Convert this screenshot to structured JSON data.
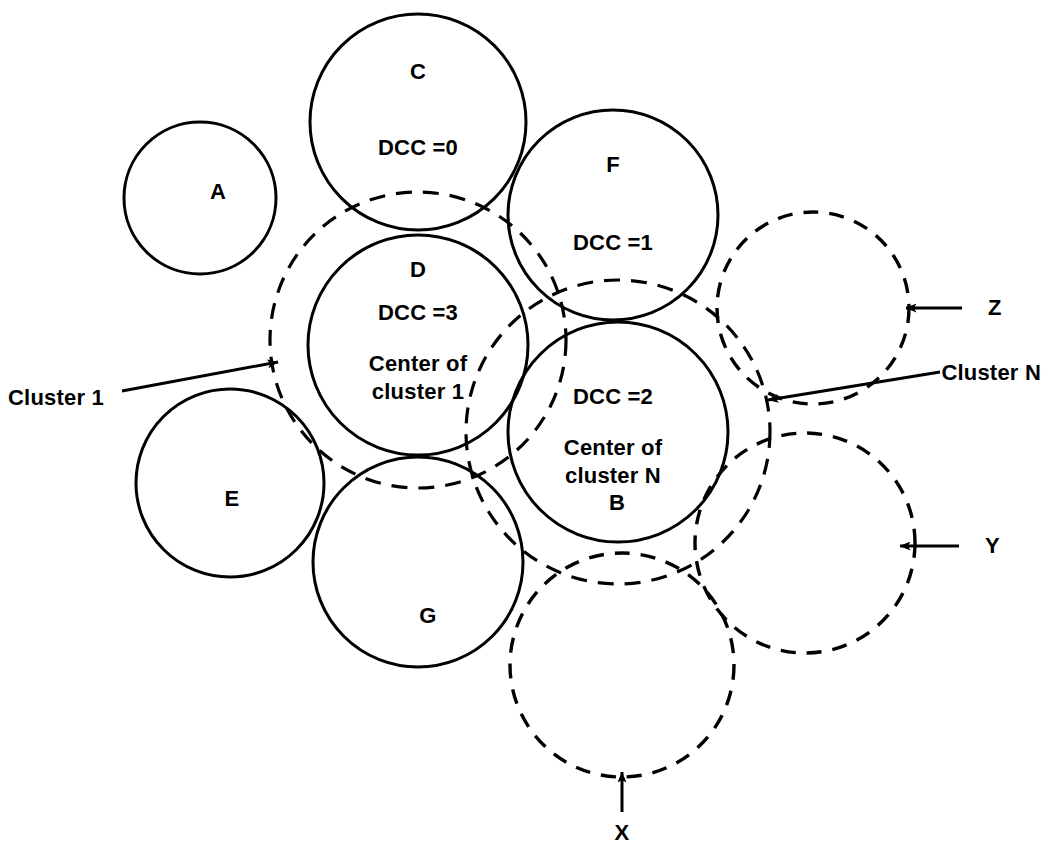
{
  "figure": {
    "type": "packing-diagram",
    "stroke_color": "#000000",
    "background_color": "#ffffff"
  },
  "circles": [
    {
      "id": "A",
      "label": "A",
      "style": "solid",
      "cx": 200,
      "cy": 198,
      "r": 76,
      "label_x": 218,
      "label_y": 192,
      "dcc": null
    },
    {
      "id": "C",
      "label": "C",
      "style": "solid",
      "cx": 418,
      "cy": 122,
      "r": 108,
      "label_x": 418,
      "label_y": 72,
      "dcc": "DCC =0",
      "dcc_x": 418,
      "dcc_y": 148
    },
    {
      "id": "F",
      "label": "F",
      "style": "solid",
      "cx": 613,
      "cy": 215,
      "r": 105,
      "label_x": 613,
      "label_y": 165,
      "dcc": "DCC =1",
      "dcc_x": 613,
      "dcc_y": 243
    },
    {
      "id": "D",
      "label": "D",
      "style": "solid",
      "cx": 418,
      "cy": 345,
      "r": 110,
      "label_x": 418,
      "label_y": 270,
      "dcc": "DCC =3",
      "dcc_x": 418,
      "dcc_y": 313,
      "note": "Center of\ncluster 1",
      "note_x": 418,
      "note_y": 378
    },
    {
      "id": "B",
      "label": "B",
      "style": "solid",
      "cx": 618,
      "cy": 432,
      "r": 110,
      "label_x": 617,
      "label_y": 503,
      "dcc": "DCC =2",
      "dcc_x": 613,
      "dcc_y": 397,
      "note": "Center of\ncluster N",
      "note_x": 613,
      "note_y": 462
    },
    {
      "id": "E",
      "label": "E",
      "style": "solid",
      "cx": 230,
      "cy": 483,
      "r": 94,
      "label_x": 232,
      "label_y": 499,
      "dcc": null
    },
    {
      "id": "G",
      "label": "G",
      "style": "solid",
      "cx": 418,
      "cy": 562,
      "r": 105,
      "label_x": 428,
      "label_y": 616,
      "dcc": null
    },
    {
      "id": "Z",
      "label": "Z",
      "style": "dashed",
      "cx": 813,
      "cy": 308,
      "r": 96,
      "label_x": 988,
      "label_y": 308,
      "dcc": null
    },
    {
      "id": "Y",
      "label": "Y",
      "style": "dashed",
      "cx": 805,
      "cy": 543,
      "r": 110,
      "label_x": 985,
      "label_y": 546,
      "dcc": null
    },
    {
      "id": "X",
      "label": "X",
      "style": "dashed",
      "cx": 622,
      "cy": 665,
      "r": 112,
      "label_x": 622,
      "label_y": 833,
      "dcc": null
    }
  ],
  "cluster_boundaries": [
    {
      "id": "cluster-1",
      "style": "dashed",
      "cx": 418,
      "cy": 340,
      "r": 148
    },
    {
      "id": "cluster-n",
      "style": "dashed",
      "cx": 618,
      "cy": 432,
      "r": 152
    }
  ],
  "annotations": [
    {
      "id": "cluster-1-label",
      "text": "Cluster 1",
      "x": 8,
      "y": 398,
      "align": "left",
      "leader": {
        "x1": 122,
        "y1": 391,
        "x2": 278,
        "y2": 362
      },
      "arrow": "right"
    },
    {
      "id": "cluster-n-label",
      "text": "Cluster N",
      "x": 1041,
      "y": 373,
      "align": "right",
      "leader": {
        "x1": 940,
        "y1": 372,
        "x2": 768,
        "y2": 400
      },
      "arrow": "left"
    },
    {
      "id": "z-label",
      "text": "Z",
      "x": 988,
      "y": 308,
      "align": "left",
      "leader": {
        "x1": 962,
        "y1": 308,
        "x2": 906,
        "y2": 308
      },
      "arrow": "left"
    },
    {
      "id": "y-label",
      "text": "Y",
      "x": 985,
      "y": 546,
      "align": "left",
      "leader": {
        "x1": 959,
        "y1": 546,
        "x2": 900,
        "y2": 546
      },
      "arrow": "left"
    },
    {
      "id": "x-label",
      "text": "X",
      "x": 622,
      "y": 833,
      "align": "center",
      "leader": {
        "x1": 622,
        "y1": 812,
        "x2": 622,
        "y2": 772
      },
      "arrow": "up"
    }
  ],
  "text_values": {
    "dcc_c": "DCC =0",
    "dcc_f": "DCC =1",
    "dcc_b": "DCC =2",
    "dcc_d": "DCC =3",
    "center_of_cluster_1_line1": "Center of",
    "center_of_cluster_1_line2": "cluster 1",
    "center_of_cluster_n_line1": "Center of",
    "center_of_cluster_n_line2": "cluster N",
    "cluster_1": "Cluster 1",
    "cluster_n": "Cluster N",
    "label_a": "A",
    "label_b": "B",
    "label_c": "C",
    "label_d": "D",
    "label_e": "E",
    "label_f": "F",
    "label_g": "G",
    "label_x": "X",
    "label_y": "Y",
    "label_z": "Z"
  }
}
